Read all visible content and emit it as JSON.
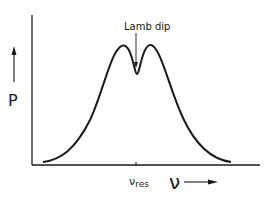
{
  "figure": {
    "y_axis_label": "P",
    "x_axis_label": "ν",
    "annotation": "Lamb dip",
    "tick_label_main": "ν",
    "tick_label_sub": "res",
    "colors": {
      "ink": "#1a1a1a",
      "background": "#ffffff"
    }
  },
  "curve": {
    "description": "Doppler-broadened gain/power profile with a narrow Lamb dip at line center",
    "features": [
      "left peak",
      "central Lamb dip at ν_res",
      "right peak"
    ]
  }
}
